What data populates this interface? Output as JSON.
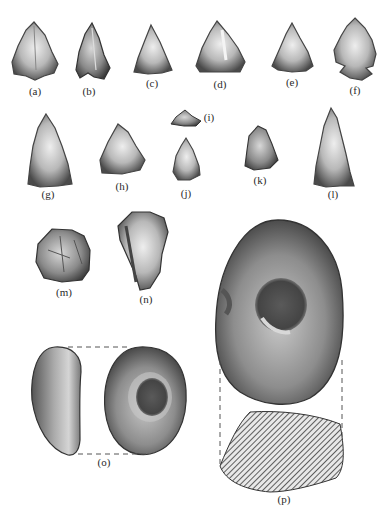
{
  "plate": {
    "background": "#ffffff",
    "ink_color": "#3a3a3a"
  },
  "figures": [
    {
      "id": "a",
      "label": "(a)",
      "type": "triangular point"
    },
    {
      "id": "b",
      "label": "(b)",
      "type": "triangular point"
    },
    {
      "id": "c",
      "label": "(c)",
      "type": "triangular point"
    },
    {
      "id": "d",
      "label": "(d)",
      "type": "triangular point"
    },
    {
      "id": "e",
      "label": "(e)",
      "type": "triangular point"
    },
    {
      "id": "f",
      "label": "(f)",
      "type": "notched point"
    },
    {
      "id": "g",
      "label": "(g)",
      "type": "triangular point"
    },
    {
      "id": "h",
      "label": "(h)",
      "type": "triangular point"
    },
    {
      "id": "i",
      "label": "(i)",
      "type": "small point"
    },
    {
      "id": "j",
      "label": "(j)",
      "type": "triangular point"
    },
    {
      "id": "k",
      "label": "(k)",
      "type": "flake"
    },
    {
      "id": "l",
      "label": "(l)",
      "type": "elongated point"
    },
    {
      "id": "m",
      "label": "(m)",
      "type": "core"
    },
    {
      "id": "n",
      "label": "(n)",
      "type": "flake"
    },
    {
      "id": "o",
      "label": "(o)",
      "type": "pitted stone, side and face views"
    },
    {
      "id": "p",
      "label": "(p)",
      "type": "pitted stone with hatched cross-section"
    }
  ]
}
